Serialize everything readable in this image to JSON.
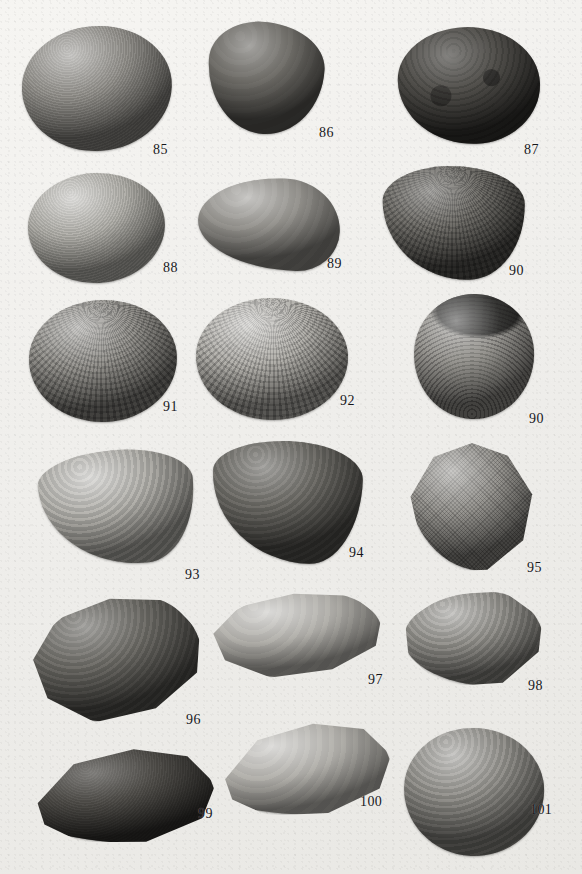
{
  "plate": {
    "background_color": "#f2f1ee",
    "width": 582,
    "height": 874,
    "caption": "",
    "specimen_count": 17,
    "number_range": "85-101"
  },
  "specimens": [
    {
      "number": "85",
      "row": 1,
      "shape": "round",
      "tone": "mid",
      "sculpture": "concentric",
      "note": "large rounded valve, fine concentric growth lines, notched anterior dorsal margin",
      "x": 22,
      "y": 26,
      "w": 150,
      "h": 125,
      "rotate": -4,
      "label_x": 153,
      "label_y": 143
    },
    {
      "number": "86",
      "row": 1,
      "shape": "cordate",
      "tone": "dark",
      "sculpture": "smooth",
      "note": "dark ovate-cordate valve, nearly smooth surface",
      "x": 208,
      "y": 22,
      "w": 116,
      "h": 112,
      "rotate": 3,
      "label_x": 319,
      "label_y": 126
    },
    {
      "number": "87",
      "row": 1,
      "shape": "ovate",
      "tone": "vdark",
      "sculpture": "mottled",
      "note": "very dark worn valve with mottled eroded surface",
      "x": 398,
      "y": 27,
      "w": 142,
      "h": 117,
      "rotate": -2,
      "label_x": 524,
      "label_y": 143
    },
    {
      "number": "88",
      "row": 2,
      "shape": "round",
      "tone": "light",
      "sculpture": "concentric",
      "note": "pale rounded valve, concentric threads, notched dorsal margin",
      "x": 28,
      "y": 173,
      "w": 137,
      "h": 110,
      "rotate": -3,
      "label_x": 163,
      "label_y": 261
    },
    {
      "number": "89",
      "row": 2,
      "shape": "wedge",
      "tone": "mid",
      "sculpture": "smooth",
      "note": "oblique wedge-shaped valve with small projecting umbo",
      "x": 198,
      "y": 178,
      "w": 142,
      "h": 92,
      "rotate": 2,
      "label_x": 327,
      "label_y": 257
    },
    {
      "number": "90",
      "row": 2,
      "shape": "trigonal",
      "tone": "dark",
      "sculpture": "cancellate",
      "note": "exterior view: strong radial ribs crossed by concentric lamellae (cancellate)",
      "x": 383,
      "y": 166,
      "w": 142,
      "h": 114,
      "rotate": -1,
      "label_x": 509,
      "label_y": 264
    },
    {
      "number": "91",
      "row": 3,
      "shape": "round",
      "tone": "mid",
      "sculpture": "cancellate",
      "note": "rounded valve with fine radial riblets and concentric threads",
      "x": 29,
      "y": 300,
      "w": 148,
      "h": 122,
      "rotate": -2,
      "label_x": 163,
      "label_y": 400
    },
    {
      "number": "92",
      "row": 3,
      "shape": "round",
      "tone": "light",
      "sculpture": "cancellate",
      "note": "pale rounded valve, dense reticulate sculpture",
      "x": 196,
      "y": 298,
      "w": 152,
      "h": 122,
      "rotate": 1,
      "label_x": 340,
      "label_y": 394
    },
    {
      "number": "90",
      "row": 3,
      "shape": "round",
      "tone": "mid",
      "sculpture": "interior",
      "note": "interior view of the same specimen: hinge, umbonal cavity and crenulate margin",
      "x": 414,
      "y": 294,
      "w": 120,
      "h": 125,
      "rotate": 2,
      "label_x": 529,
      "label_y": 412
    },
    {
      "number": "93",
      "row": 4,
      "shape": "subtrig",
      "tone": "light",
      "sculpture": "rings",
      "note": "pale subtrigonal valve with coarse concentric growth rings",
      "x": 40,
      "y": 450,
      "w": 155,
      "h": 115,
      "rotate": -5,
      "label_x": 185,
      "label_y": 568
    },
    {
      "number": "94",
      "row": 4,
      "shape": "subtrig",
      "tone": "dark",
      "sculpture": "rings",
      "note": "dark subtrigonal valve, strong comarginal lamellae",
      "x": 212,
      "y": 441,
      "w": 150,
      "h": 122,
      "rotate": 2,
      "label_x": 349,
      "label_y": 546
    },
    {
      "number": "95",
      "row": 4,
      "shape": "trigonal",
      "tone": "mid",
      "sculpture": "granular",
      "clip": "clip-trigonal",
      "note": "trigonal valve with fine granular cross-hatched microsculpture",
      "x": 408,
      "y": 443,
      "w": 128,
      "h": 128,
      "rotate": 0,
      "label_x": 527,
      "label_y": 561
    },
    {
      "number": "96",
      "row": 5,
      "shape": "elongate",
      "tone": "dark",
      "sculpture": "rings",
      "clip": "clip-tongue",
      "note": "obliquely elongate valve with heavy concentric ridges",
      "x": 30,
      "y": 596,
      "w": 172,
      "h": 125,
      "rotate": -6,
      "label_x": 186,
      "label_y": 713
    },
    {
      "number": "97",
      "row": 5,
      "shape": "elongate",
      "tone": "light",
      "sculpture": "smooth",
      "clip": "clip-tongue",
      "note": "pale elongate-ovate valve, smooth with faint growth halts",
      "x": 210,
      "y": 592,
      "w": 172,
      "h": 85,
      "rotate": -3,
      "label_x": 368,
      "label_y": 673
    },
    {
      "number": "98",
      "row": 5,
      "shape": "wedge",
      "tone": "mid",
      "sculpture": "rings",
      "clip": "clip-wedge",
      "note": "subquadrate valve with concentric undulations",
      "x": 404,
      "y": 592,
      "w": 140,
      "h": 95,
      "rotate": -1,
      "label_x": 528,
      "label_y": 679
    },
    {
      "number": "99",
      "row": 6,
      "shape": "mytiliform",
      "tone": "vdark",
      "sculpture": "concentric",
      "clip": "clip-mussel",
      "note": "very dark elongate valve with pale reflective inner rim",
      "x": 26,
      "y": 748,
      "w": 190,
      "h": 98,
      "rotate": -3,
      "label_x": 198,
      "label_y": 807
    },
    {
      "number": "100",
      "row": 6,
      "shape": "mytiliform",
      "tone": "light",
      "sculpture": "smooth",
      "clip": "clip-mussel",
      "note": "pale elongate mytiliform valve, smooth surface",
      "x": 214,
      "y": 723,
      "w": 178,
      "h": 95,
      "rotate": -5,
      "label_x": 360,
      "label_y": 795
    },
    {
      "number": "101",
      "row": 6,
      "shape": "round",
      "tone": "mid",
      "sculpture": "rings",
      "note": "rounded valve with strong concentric ribs, dark ventral shading",
      "x": 404,
      "y": 728,
      "w": 140,
      "h": 128,
      "rotate": 3,
      "label_x": 530,
      "label_y": 803
    }
  ]
}
